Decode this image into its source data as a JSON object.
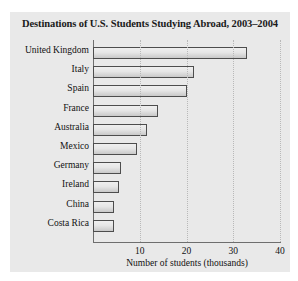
{
  "chart_data": {
    "type": "bar",
    "orientation": "horizontal",
    "title": "Destinations of U.S. Students Studying Abroad, 2003–2004",
    "xlabel": "Number of students (thousands)",
    "ylabel": "",
    "categories": [
      "United Kingdom",
      "Italy",
      "Spain",
      "France",
      "Australia",
      "Mexico",
      "Germany",
      "Ireland",
      "China",
      "Costa Rica"
    ],
    "values": [
      33,
      21.5,
      20,
      14,
      11.5,
      9.5,
      6,
      5.5,
      4.5,
      4.5
    ],
    "xlim": [
      0,
      40
    ],
    "xticks": [
      10,
      20,
      30,
      40
    ],
    "xtick_labels": [
      "10",
      "20",
      "30",
      "40"
    ],
    "grid": true,
    "grid_axis": "x",
    "legend": false,
    "colors": {
      "bar_fill_top": "#efefef",
      "bar_fill_bottom": "#c9c9c9",
      "bar_edge": "#4d4d4d",
      "panel_background": "#e9e9e9",
      "axis": "#6e6e6e",
      "gridline": "#b9b9b9",
      "text": "#111111"
    }
  }
}
